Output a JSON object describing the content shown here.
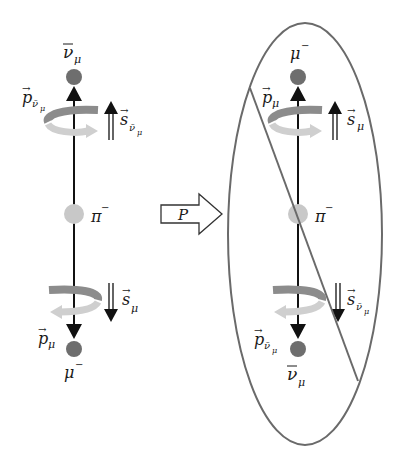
{
  "figure": {
    "colors": {
      "background": "#ffffff",
      "axis_line": "#111111",
      "particle_dark": "#6e6e6e",
      "particle_pion": "#c8c8c8",
      "rotation_dark": "#8c8c8c",
      "rotation_light": "#cfcfcf",
      "ellipse": "#6a6a6a",
      "strike_line": "#6a6a6a"
    },
    "left_panel": {
      "top_particle": {
        "symbol": "ν",
        "bar": true,
        "subscript": "μ",
        "superscript": ""
      },
      "top_momentum": {
        "vec": "p",
        "subscript": "ν̄",
        "subsub": "μ"
      },
      "top_spin": {
        "vec": "s",
        "subscript": "ν̄",
        "subsub": "μ",
        "direction": "up"
      },
      "center_particle": {
        "symbol": "π",
        "superscript": "−"
      },
      "bottom_spin": {
        "vec": "s",
        "subscript": "μ",
        "direction": "down"
      },
      "bottom_momentum": {
        "vec": "p",
        "subscript": "μ"
      },
      "bottom_particle": {
        "symbol": "μ",
        "superscript": "−"
      }
    },
    "operator": {
      "label": "P"
    },
    "right_panel": {
      "top_particle": {
        "symbol": "μ",
        "superscript": "−"
      },
      "top_momentum": {
        "vec": "p",
        "subscript": "μ"
      },
      "top_spin": {
        "vec": "s",
        "subscript": "μ",
        "direction": "up"
      },
      "center_particle": {
        "symbol": "π",
        "superscript": "−"
      },
      "bottom_spin": {
        "vec": "s",
        "subscript": "ν̄",
        "subsub": "μ",
        "direction": "down"
      },
      "bottom_momentum": {
        "vec": "p",
        "subscript": "ν̄",
        "subsub": "μ"
      },
      "bottom_particle": {
        "symbol": "ν",
        "bar": true,
        "subscript": "μ"
      },
      "struck_out": true
    }
  }
}
